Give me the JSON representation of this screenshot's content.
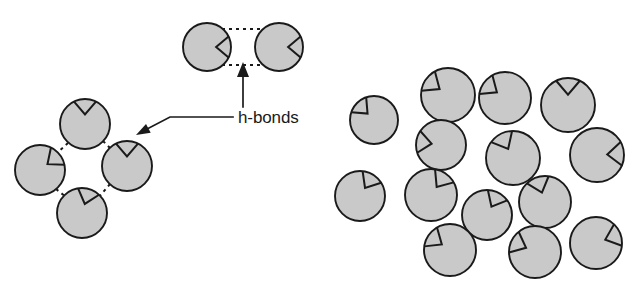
{
  "figure": {
    "name": "water-molecule-hydrogen-bonding-diagram",
    "background_color": "#ffffff"
  },
  "style": {
    "molecule_fill": "#c9c9c9",
    "molecule_stroke": "#1a1a1a",
    "hbond_stroke": "#1a1a1a",
    "text_color": "#1a1a1a",
    "molecule_radius": 24,
    "notch_half_angle_deg": 26,
    "notch_depth_ratio": 0.62
  },
  "annotation": {
    "label": "h-bonds",
    "label_x": 238,
    "label_y": 123,
    "leader_line": {
      "points": "233,117 170,117 143,131",
      "arrow_tip_x": 136,
      "arrow_tip_y": 135,
      "arrow_angle_deg": 152
    },
    "vertical_arrow": {
      "shaft_x": 243,
      "shaft_top_y": 66,
      "shaft_bottom_y": 107,
      "arrow_tip_x": 243,
      "arrow_tip_y": 62,
      "arrow_angle_deg": -90
    }
  },
  "groups": [
    {
      "id": "top-pair",
      "name": "hydrogen-bonded-pair",
      "molecules": [
        {
          "id": "tp-1",
          "cx": 207,
          "cy": 47,
          "r": 24,
          "notch_angle_deg": 0
        },
        {
          "id": "tp-2",
          "cx": 279,
          "cy": 47,
          "r": 24,
          "notch_angle_deg": 0
        }
      ],
      "bonds": [
        {
          "x1": 215,
          "y1": 29,
          "x2": 271,
          "y2": 29,
          "dash": "3,4"
        },
        {
          "x1": 215,
          "y1": 65,
          "x2": 271,
          "y2": 65,
          "dash": "3,4"
        }
      ]
    },
    {
      "id": "left-cluster",
      "name": "ordered-ice-cluster",
      "molecules": [
        {
          "id": "lc-top",
          "cx": 85,
          "cy": 124,
          "r": 25,
          "notch_angle_deg": 90
        },
        {
          "id": "lc-left",
          "cx": 40,
          "cy": 170,
          "r": 25,
          "notch_angle_deg": 38
        },
        {
          "id": "lc-right",
          "cx": 127,
          "cy": 166,
          "r": 25,
          "notch_angle_deg": 90
        },
        {
          "id": "lc-bottom",
          "cx": 82,
          "cy": 213,
          "r": 25,
          "notch_angle_deg": 73
        }
      ],
      "bonds": [
        {
          "x1": 68,
          "y1": 143,
          "x2": 57,
          "y2": 153,
          "dash": "3,4"
        },
        {
          "x1": 103,
          "y1": 141,
          "x2": 111,
          "y2": 149,
          "dash": "3,4"
        },
        {
          "x1": 56,
          "y1": 189,
          "x2": 66,
          "y2": 197,
          "dash": "3,4"
        },
        {
          "x1": 110,
          "y1": 184,
          "x2": 99,
          "y2": 197,
          "dash": "3,4"
        }
      ]
    },
    {
      "id": "right-cluster",
      "name": "disordered-liquid-cluster",
      "bonds": [],
      "molecules": [
        {
          "id": "rc-1",
          "cx": 374,
          "cy": 120,
          "r": 24,
          "notch_angle_deg": 135
        },
        {
          "id": "rc-2",
          "cx": 448,
          "cy": 95,
          "r": 27,
          "notch_angle_deg": 145
        },
        {
          "id": "rc-3",
          "cx": 505,
          "cy": 98,
          "r": 26,
          "notch_angle_deg": 145
        },
        {
          "id": "rc-4",
          "cx": 568,
          "cy": 105,
          "r": 27,
          "notch_angle_deg": 90
        },
        {
          "id": "rc-5",
          "cx": 441,
          "cy": 145,
          "r": 25,
          "notch_angle_deg": 172
        },
        {
          "id": "rc-6",
          "cx": 513,
          "cy": 158,
          "r": 27,
          "notch_angle_deg": 118
        },
        {
          "id": "rc-7",
          "cx": 597,
          "cy": 155,
          "r": 27,
          "notch_angle_deg": 3
        },
        {
          "id": "rc-8",
          "cx": 360,
          "cy": 196,
          "r": 25,
          "notch_angle_deg": 58
        },
        {
          "id": "rc-9",
          "cx": 431,
          "cy": 195,
          "r": 26,
          "notch_angle_deg": 55
        },
        {
          "id": "rc-10",
          "cx": 487,
          "cy": 215,
          "r": 25,
          "notch_angle_deg": 62
        },
        {
          "id": "rc-11",
          "cx": 545,
          "cy": 202,
          "r": 26,
          "notch_angle_deg": 108
        },
        {
          "id": "rc-12",
          "cx": 450,
          "cy": 250,
          "r": 26,
          "notch_angle_deg": 146
        },
        {
          "id": "rc-13",
          "cx": 535,
          "cy": 252,
          "r": 26,
          "notch_angle_deg": 155
        },
        {
          "id": "rc-14",
          "cx": 596,
          "cy": 243,
          "r": 26,
          "notch_angle_deg": 20
        }
      ]
    }
  ]
}
